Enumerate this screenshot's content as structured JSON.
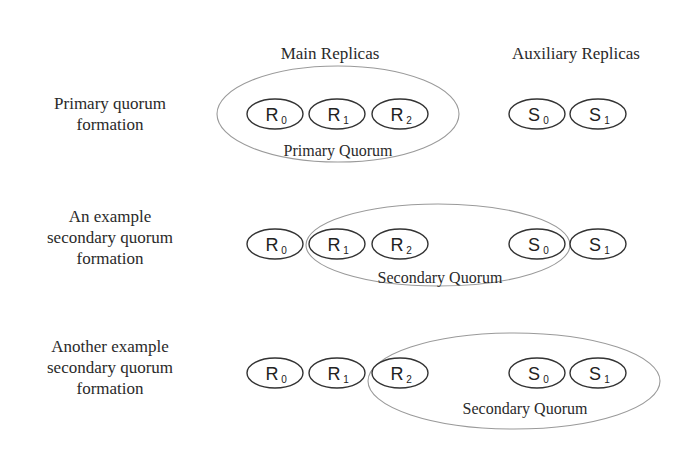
{
  "headers": {
    "main": "Main Replicas",
    "auxiliary": "Auxiliary Replicas"
  },
  "rows": [
    {
      "label_lines": [
        "Primary quorum",
        "formation"
      ],
      "quorum_label": "Primary Quorum",
      "quorum_members": [
        "R0",
        "R1",
        "R2"
      ]
    },
    {
      "label_lines": [
        "An example",
        "secondary quorum",
        "formation"
      ],
      "quorum_label": "Secondary Quorum",
      "quorum_members": [
        "R1",
        "R2",
        "S0"
      ]
    },
    {
      "label_lines": [
        "Another example",
        "secondary quorum",
        "formation"
      ],
      "quorum_label": "Secondary Quorum",
      "quorum_members": [
        "R2",
        "S0",
        "S1"
      ]
    }
  ],
  "nodes": {
    "R0": {
      "letter": "R",
      "sub": "0"
    },
    "R1": {
      "letter": "R",
      "sub": "1"
    },
    "R2": {
      "letter": "R",
      "sub": "2"
    },
    "S0": {
      "letter": "S",
      "sub": "0"
    },
    "S1": {
      "letter": "S",
      "sub": "1"
    }
  }
}
